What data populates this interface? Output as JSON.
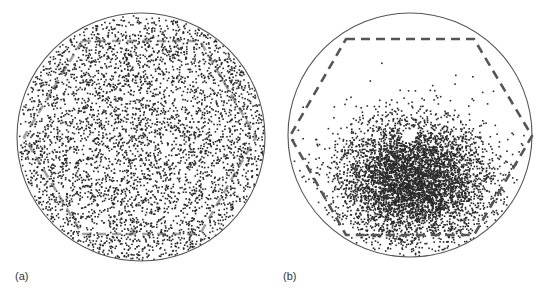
{
  "figure": {
    "panels": [
      {
        "id": "a",
        "label": "(a)"
      },
      {
        "id": "b",
        "label": "(b)"
      }
    ]
  },
  "colors": {
    "circle": "#555555",
    "hexagon": "#555555",
    "dot": "#2a2a2a",
    "label": "#333333"
  },
  "chart_data": [
    {
      "type": "scatter",
      "title": "(a)",
      "description": "Points distributed uniformly across a circular field with a dashed hexagon overlay",
      "circle": {
        "cx": 141,
        "cy": 137,
        "r": 124
      },
      "hexagon": [
        [
          82,
          41
        ],
        [
          200,
          41
        ],
        [
          256,
          137
        ],
        [
          200,
          234
        ],
        [
          82,
          234
        ],
        [
          24,
          137
        ]
      ],
      "distribution": {
        "kind": "uniform",
        "count": 4200,
        "seed": 11
      },
      "grid": false,
      "legend": null
    },
    {
      "type": "scatter",
      "title": "(b)",
      "description": "Points concentrated in a dense cluster in the lower-right part of the circle, with a small empty hole near the cluster top",
      "circle": {
        "cx": 410,
        "cy": 135,
        "r": 122
      },
      "hexagon": [
        [
          346,
          39
        ],
        [
          474,
          39
        ],
        [
          532,
          136
        ],
        [
          474,
          235
        ],
        [
          346,
          235
        ],
        [
          290,
          136
        ]
      ],
      "distribution": {
        "kind": "gaussian",
        "count": 5200,
        "seed": 7,
        "mean": [
          414,
          180
        ],
        "sd": [
          38,
          31
        ],
        "hole": {
          "cx": 408,
          "cy": 135,
          "r": 7
        }
      },
      "grid": false,
      "legend": null
    }
  ]
}
